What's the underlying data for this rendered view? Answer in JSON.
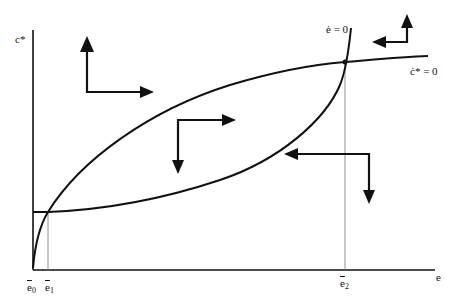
{
  "diagram": {
    "type": "phase-diagram",
    "axes": {
      "y_label": "c*",
      "x_label": "e"
    },
    "curves": [
      {
        "name": "e-dot-zero",
        "label": "ė = 0"
      },
      {
        "name": "c-star-dot-zero",
        "label": "ċ* = 0"
      }
    ],
    "x_ticks": [
      {
        "base": "e",
        "sub": "0"
      },
      {
        "base": "e",
        "sub": "1"
      },
      {
        "base": "e",
        "sub": "2"
      }
    ],
    "arrows": [
      {
        "region": "upper-left",
        "directions": [
          "up",
          "right"
        ]
      },
      {
        "region": "center-lens",
        "directions": [
          "right",
          "down"
        ]
      },
      {
        "region": "lower-right",
        "directions": [
          "left",
          "down"
        ]
      },
      {
        "region": "upper-right",
        "directions": [
          "left",
          "up"
        ]
      }
    ],
    "colors": {
      "ink": "#111111",
      "guide": "#777777",
      "background": "#ffffff"
    }
  }
}
